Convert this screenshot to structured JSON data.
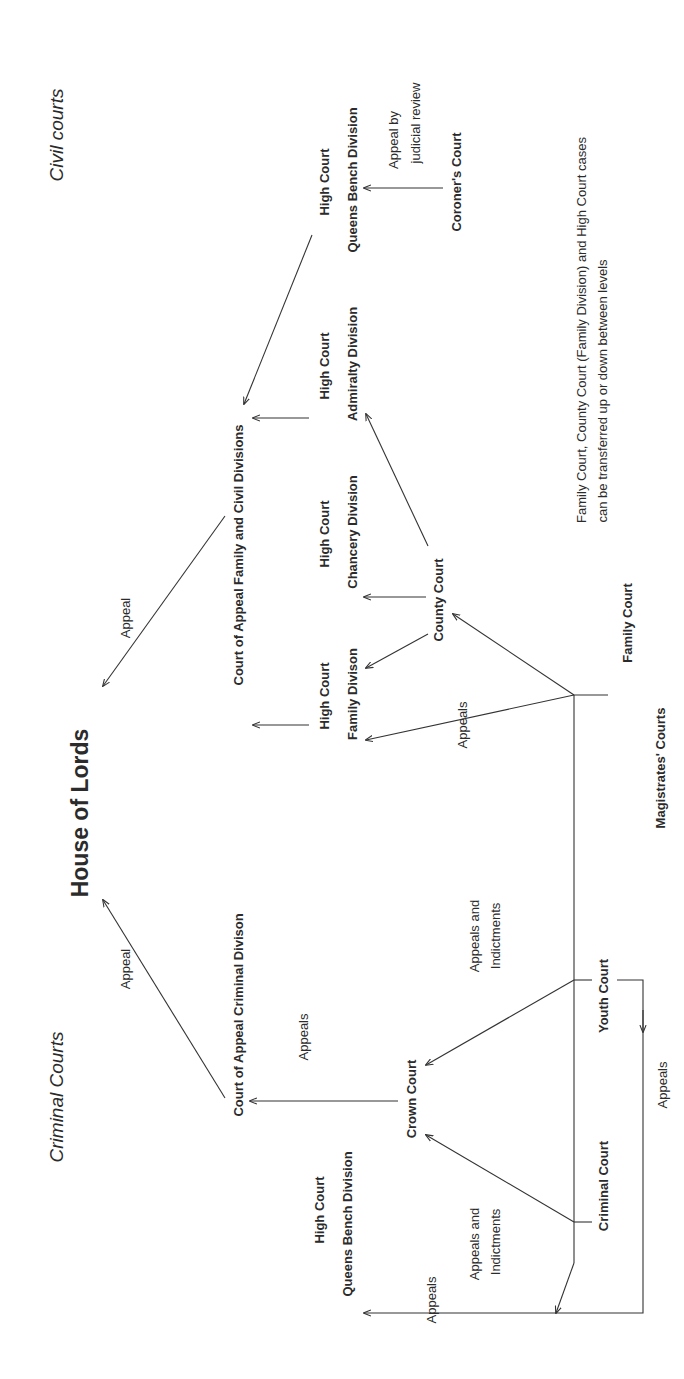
{
  "diagram": {
    "orientation": "rotated-90-ccw",
    "sections": {
      "civil": "Civil courts",
      "criminal": "Criminal Courts"
    },
    "apex": "House of Lords",
    "nodes": {
      "court_of_appeal_civil": "Court of Appeal Family and Civil Divisions",
      "court_of_appeal_criminal": "Court of Appeal Criminal Divison",
      "hc_qbd_civil": {
        "line1": "High Court",
        "line2": "Queens Bench Division"
      },
      "hc_admiralty": {
        "line1": "High Court",
        "line2": "Admiralty Division"
      },
      "hc_chancery": {
        "line1": "High Court",
        "line2": "Chancery Division"
      },
      "hc_family": {
        "line1": "High Court",
        "line2": "Family Divison"
      },
      "hc_qbd_criminal": {
        "line1": "High Court",
        "line2": "Queens Bench Division"
      },
      "coroners_court": "Coroner's Court",
      "county_court": "County Court",
      "crown_court": "Crown Court",
      "family_court": "Family Court",
      "youth_court": "Youth Court",
      "criminal_court": "Criminal Court",
      "magistrates_courts": "Magistrates' Courts"
    },
    "edge_labels": {
      "appeal_civil_to_lords": "Appeal",
      "appeal_criminal_to_lords": "Appeal",
      "judicial_review": {
        "line1": "Appeal by",
        "line2": "judicial review"
      },
      "appeals_family_to_hcfd": "Appeals",
      "appeals_crown_to_coa": "Appeals",
      "appeals_indictments_youth": {
        "line1": "Appeals and",
        "line2": "Indictments"
      },
      "appeals_indictments_criminal": {
        "line1": "Appeals and",
        "line2": "Indictments"
      },
      "appeals_youth_loop": "Appeals",
      "appeals_to_qbd": "Appeals"
    },
    "note": {
      "line1": "Family Court, County Court (Family Division) and High Court cases",
      "line2": "can be transferred up or down between levels"
    }
  }
}
